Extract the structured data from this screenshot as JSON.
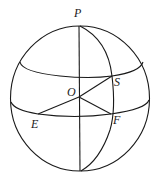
{
  "diagram": {
    "type": "sphere-geometry",
    "labels": {
      "P": "P",
      "O": "O",
      "S": "S",
      "E": "E",
      "F": "F"
    },
    "points": {
      "P": [
        79,
        26
      ],
      "O": [
        79,
        97
      ],
      "S": [
        112,
        76
      ],
      "E": [
        38,
        114
      ],
      "F": [
        111,
        114
      ],
      "bottom": [
        81,
        171
      ]
    },
    "colors": {
      "line": "#1a1a1a",
      "background": "#ffffff"
    }
  }
}
